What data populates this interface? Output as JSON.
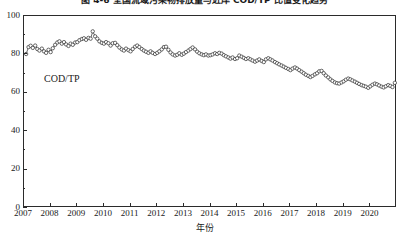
{
  "chart_data": {
    "type": "line",
    "title": "图 4-6  全国流域污染物排放量与近岸 COD/TP 比值变化趋势",
    "xlabel": "年份",
    "ylabel": "",
    "annotation": "COD/TP",
    "grid": false,
    "legend_position": "none",
    "marker": "open-circle",
    "series_color": "#2b2b2b",
    "xlim": [
      2007.0,
      2021.0
    ],
    "ylim": [
      0,
      100
    ],
    "ytick_labels": [
      "0",
      "20",
      "40",
      "60",
      "80",
      "100"
    ],
    "ytick_values": [
      0,
      20,
      40,
      60,
      80,
      100
    ],
    "yminor_values": [
      10,
      30,
      50,
      70,
      90
    ],
    "xtick_labels": [
      "2007",
      "2008",
      "2009",
      "2010",
      "2011",
      "2012",
      "2013",
      "2014",
      "2015",
      "2016",
      "2017",
      "2018",
      "2019",
      "2020"
    ],
    "xtick_values": [
      2007,
      2008,
      2009,
      2010,
      2011,
      2012,
      2013,
      2014,
      2015,
      2016,
      2017,
      2018,
      2019,
      2020
    ],
    "series": [
      {
        "name": "COD/TP",
        "x": [
          2007.08,
          2007.17,
          2007.25,
          2007.33,
          2007.42,
          2007.5,
          2007.58,
          2007.67,
          2007.75,
          2007.83,
          2007.92,
          2008.0,
          2008.08,
          2008.17,
          2008.25,
          2008.33,
          2008.42,
          2008.5,
          2008.58,
          2008.67,
          2008.75,
          2008.83,
          2008.92,
          2009.0,
          2009.08,
          2009.17,
          2009.25,
          2009.33,
          2009.42,
          2009.5,
          2009.58,
          2009.67,
          2009.75,
          2009.83,
          2009.92,
          2010.0,
          2010.08,
          2010.17,
          2010.25,
          2010.33,
          2010.42,
          2010.5,
          2010.58,
          2010.67,
          2010.75,
          2010.83,
          2010.92,
          2011.0,
          2011.08,
          2011.17,
          2011.25,
          2011.33,
          2011.42,
          2011.5,
          2011.58,
          2011.67,
          2011.75,
          2011.83,
          2011.92,
          2012.0,
          2012.08,
          2012.17,
          2012.25,
          2012.33,
          2012.42,
          2012.5,
          2012.58,
          2012.67,
          2012.75,
          2012.83,
          2012.92,
          2013.0,
          2013.08,
          2013.17,
          2013.25,
          2013.33,
          2013.42,
          2013.5,
          2013.58,
          2013.67,
          2013.75,
          2013.83,
          2013.92,
          2014.0,
          2014.08,
          2014.17,
          2014.25,
          2014.33,
          2014.42,
          2014.5,
          2014.58,
          2014.67,
          2014.75,
          2014.83,
          2014.92,
          2015.0,
          2015.08,
          2015.17,
          2015.25,
          2015.33,
          2015.42,
          2015.5,
          2015.58,
          2015.67,
          2015.75,
          2015.83,
          2015.92,
          2016.0,
          2016.08,
          2016.17,
          2016.25,
          2016.33,
          2016.42,
          2016.5,
          2016.58,
          2016.67,
          2016.75,
          2016.83,
          2016.92,
          2017.0,
          2017.08,
          2017.17,
          2017.25,
          2017.33,
          2017.42,
          2017.5,
          2017.58,
          2017.67,
          2017.75,
          2017.83,
          2017.92,
          2018.0,
          2018.08,
          2018.17,
          2018.25,
          2018.33,
          2018.42,
          2018.5,
          2018.58,
          2018.67,
          2018.75,
          2018.83,
          2018.92,
          2019.0,
          2019.08,
          2019.17,
          2019.25,
          2019.33,
          2019.42,
          2019.5,
          2019.58,
          2019.67,
          2019.75,
          2019.83,
          2019.92,
          2020.0,
          2020.08,
          2020.17,
          2020.25,
          2020.33,
          2020.42,
          2020.5,
          2020.58,
          2020.67,
          2020.75,
          2020.83,
          2020.92
        ],
        "values": [
          80.2,
          83.8,
          84.5,
          83.4,
          84.6,
          82.8,
          82.0,
          83.0,
          81.6,
          80.8,
          82.4,
          81.2,
          83.2,
          85.0,
          86.2,
          86.8,
          85.6,
          86.4,
          85.2,
          84.4,
          85.6,
          85.0,
          86.2,
          86.4,
          87.4,
          88.0,
          88.4,
          87.6,
          88.6,
          88.2,
          92.0,
          89.4,
          88.2,
          86.8,
          86.0,
          85.6,
          86.4,
          85.8,
          84.6,
          85.8,
          86.0,
          84.8,
          83.6,
          82.6,
          82.0,
          83.0,
          82.2,
          81.6,
          82.8,
          84.0,
          84.6,
          83.8,
          82.8,
          82.0,
          81.4,
          80.8,
          81.6,
          80.8,
          80.2,
          80.8,
          81.6,
          82.6,
          83.8,
          84.0,
          82.4,
          81.0,
          80.0,
          79.4,
          79.8,
          80.6,
          79.8,
          80.4,
          81.2,
          82.0,
          82.8,
          83.6,
          82.6,
          81.4,
          80.6,
          80.0,
          79.6,
          80.0,
          79.4,
          79.6,
          80.0,
          80.6,
          80.2,
          80.8,
          80.4,
          79.6,
          79.0,
          78.4,
          77.8,
          78.4,
          77.6,
          78.0,
          79.4,
          78.8,
          78.2,
          77.6,
          78.0,
          77.4,
          76.8,
          76.2,
          76.8,
          77.4,
          76.6,
          76.0,
          77.4,
          78.0,
          77.4,
          76.8,
          76.0,
          75.4,
          74.8,
          74.2,
          73.6,
          73.0,
          72.4,
          71.8,
          72.6,
          73.2,
          72.6,
          71.8,
          71.0,
          70.2,
          69.4,
          68.8,
          68.2,
          68.8,
          69.6,
          70.2,
          71.2,
          71.4,
          70.2,
          69.0,
          68.0,
          67.0,
          66.2,
          65.4,
          65.0,
          64.8,
          65.4,
          66.0,
          66.8,
          67.4,
          67.0,
          66.4,
          65.8,
          65.2,
          64.6,
          64.0,
          63.6,
          63.2,
          62.6,
          63.4,
          64.2,
          64.8,
          64.4,
          63.8,
          63.2,
          62.8,
          63.4,
          64.0,
          63.6,
          63.0,
          65.2
        ]
      }
    ]
  }
}
